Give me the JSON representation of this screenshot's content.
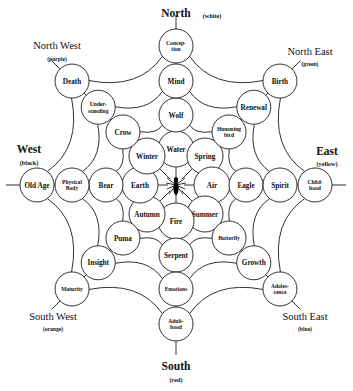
{
  "center": {
    "icon": "spider-icon",
    "label": ""
  },
  "directions": [
    {
      "id": "north",
      "name": "North",
      "color_label": "(white)",
      "color": "#ffffff"
    },
    {
      "id": "north-east",
      "name": "North East",
      "color_label": "(green)",
      "color": "#008000"
    },
    {
      "id": "east",
      "name": "East",
      "color_label": "(yellow)",
      "color": "#ffff00"
    },
    {
      "id": "south-east",
      "name": "South East",
      "color_label": "(blue)",
      "color": "#0000ff"
    },
    {
      "id": "south",
      "name": "South",
      "color_label": "(red)",
      "color": "#ff0000"
    },
    {
      "id": "south-west",
      "name": "South West",
      "color_label": "(orange)",
      "color": "#ffa500"
    },
    {
      "id": "west",
      "name": "West",
      "color_label": "(black)",
      "color": "#000000"
    },
    {
      "id": "north-west",
      "name": "North West",
      "color_label": "(purple)",
      "color": "#800080"
    }
  ],
  "rings": [
    {
      "index": 1,
      "name": "inner"
    },
    {
      "index": 2,
      "name": "second"
    },
    {
      "index": 3,
      "name": "third"
    },
    {
      "index": 4,
      "name": "outer"
    }
  ],
  "spokes": [
    {
      "direction": "north",
      "nodes": [
        {
          "ring": 1,
          "lines": [
            "Water"
          ]
        },
        {
          "ring": 2,
          "lines": [
            "Wolf"
          ]
        },
        {
          "ring": 3,
          "lines": [
            "Mind"
          ]
        },
        {
          "ring": 4,
          "lines": [
            "Concep-",
            "tion"
          ]
        }
      ]
    },
    {
      "direction": "north-east",
      "nodes": [
        {
          "ring": 1,
          "lines": [
            "Spring"
          ]
        },
        {
          "ring": 2,
          "lines": [
            "Humming",
            "bird"
          ]
        },
        {
          "ring": 3,
          "lines": [
            "Renewal"
          ]
        },
        {
          "ring": 4,
          "lines": [
            "Birth"
          ]
        }
      ]
    },
    {
      "direction": "east",
      "nodes": [
        {
          "ring": 1,
          "lines": [
            "Air"
          ]
        },
        {
          "ring": 2,
          "lines": [
            "Eagle"
          ]
        },
        {
          "ring": 3,
          "lines": [
            "Spirit"
          ]
        },
        {
          "ring": 4,
          "lines": [
            "Child-",
            "hood"
          ]
        }
      ]
    },
    {
      "direction": "south-east",
      "nodes": [
        {
          "ring": 1,
          "lines": [
            "Summer"
          ]
        },
        {
          "ring": 2,
          "lines": [
            "Butterfly"
          ]
        },
        {
          "ring": 3,
          "lines": [
            "Growth"
          ]
        },
        {
          "ring": 4,
          "lines": [
            "Adoles-",
            "cence"
          ]
        }
      ]
    },
    {
      "direction": "south",
      "nodes": [
        {
          "ring": 1,
          "lines": [
            "Fire"
          ]
        },
        {
          "ring": 2,
          "lines": [
            "Serpent"
          ]
        },
        {
          "ring": 3,
          "lines": [
            "Emotions"
          ]
        },
        {
          "ring": 4,
          "lines": [
            "Adult-",
            "hood"
          ]
        }
      ]
    },
    {
      "direction": "south-west",
      "nodes": [
        {
          "ring": 1,
          "lines": [
            "Autumn"
          ]
        },
        {
          "ring": 2,
          "lines": [
            "Puma"
          ]
        },
        {
          "ring": 3,
          "lines": [
            "Insight"
          ]
        },
        {
          "ring": 4,
          "lines": [
            "Maturity"
          ]
        }
      ]
    },
    {
      "direction": "west",
      "nodes": [
        {
          "ring": 1,
          "lines": [
            "Earth"
          ]
        },
        {
          "ring": 2,
          "lines": [
            "Bear"
          ]
        },
        {
          "ring": 3,
          "lines": [
            "Physical",
            "Body"
          ]
        },
        {
          "ring": 4,
          "lines": [
            "Old Age"
          ]
        }
      ]
    },
    {
      "direction": "north-west",
      "nodes": [
        {
          "ring": 1,
          "lines": [
            "Winter"
          ]
        },
        {
          "ring": 2,
          "lines": [
            "Crow"
          ]
        },
        {
          "ring": 3,
          "lines": [
            "Under-",
            "standing"
          ]
        },
        {
          "ring": 4,
          "lines": [
            "Death"
          ]
        }
      ]
    }
  ],
  "geometry": {
    "cx": 176,
    "cy": 185,
    "ring_radii_cardinal": [
      36,
      70,
      104,
      139
    ],
    "ring_radii_diagonal": [
      41,
      75,
      110,
      147
    ],
    "node_radius_cardinal": [
      18,
      17,
      17,
      17
    ],
    "node_radius_diagonal": [
      18,
      17,
      17,
      17
    ],
    "direction_angles_deg": {
      "north": -90,
      "north-east": -45,
      "east": 0,
      "south-east": 45,
      "south": 90,
      "south-west": 135,
      "west": 180,
      "north-west": -135
    },
    "sag": 0.8
  },
  "direction_label_positions": {
    "north": {
      "x": 176,
      "y": 17,
      "sub_x": 212,
      "sub_y": 18,
      "inline": true
    },
    "north-east": {
      "x": 310,
      "y": 55,
      "sub_x": 310,
      "sub_y": 66,
      "inline": false
    },
    "east": {
      "x": 327,
      "y": 155,
      "sub_x": 327,
      "sub_y": 166,
      "inline": false
    },
    "south-east": {
      "x": 305,
      "y": 320,
      "sub_x": 305,
      "sub_y": 331,
      "inline": false
    },
    "south": {
      "x": 176,
      "y": 370,
      "sub_x": 176,
      "sub_y": 382,
      "inline": false
    },
    "south-west": {
      "x": 53,
      "y": 320,
      "sub_x": 53,
      "sub_y": 331,
      "inline": false
    },
    "west": {
      "x": 29,
      "y": 153,
      "sub_x": 29,
      "sub_y": 165,
      "inline": false
    },
    "north-west": {
      "x": 57,
      "y": 49,
      "sub_x": 57,
      "sub_y": 61,
      "inline": false
    }
  }
}
